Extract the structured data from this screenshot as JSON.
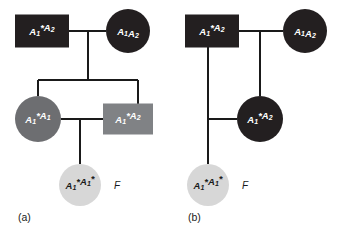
{
  "figure": {
    "type": "pedigree-diagram",
    "background_color": "#ffffff",
    "line_color": "#1a1a1a",
    "panel_count": 2
  },
  "colors": {
    "black": "#231f20",
    "dark_gray": "#6d6e71",
    "mid_gray": "#808285",
    "light_gray": "#d7d7d7",
    "white_text": "#ffffff",
    "dark_text": "#1a1a1a",
    "line": "#1a1a1a"
  },
  "panels": [
    {
      "id": "panel-a",
      "caption": "(a)",
      "caption_x": 18,
      "caption_y": 218,
      "individuals": [
        {
          "id": "a-founder-male",
          "role": "founder-male",
          "shape": "square",
          "fill": "black",
          "text_color": "white_text",
          "cx": 42,
          "cy": 31,
          "width": 54,
          "height": 33,
          "genotype": {
            "allele1": {
              "letter": "A",
              "sub": "1",
              "star": true
            },
            "allele2": {
              "letter": "A",
              "sub": "2",
              "star": false
            }
          },
          "genotype_text": "A1*A2"
        },
        {
          "id": "a-founder-female",
          "role": "founder-female",
          "shape": "circle",
          "fill": "black",
          "text_color": "white_text",
          "cx": 128,
          "cy": 31,
          "radius": 22,
          "genotype": {
            "allele1": {
              "letter": "A",
              "sub": "1",
              "star": false
            },
            "allele2": {
              "letter": "A",
              "sub": "2",
              "star": false
            }
          },
          "genotype_text": "A1A2"
        },
        {
          "id": "a-child-female",
          "role": "generation2-female",
          "shape": "circle",
          "fill": "dark_gray",
          "text_color": "white_text",
          "cx": 38,
          "cy": 119,
          "radius": 23,
          "genotype": {
            "allele1": {
              "letter": "A",
              "sub": "1",
              "star": true
            },
            "allele2": {
              "letter": "A",
              "sub": "1",
              "star": false
            }
          },
          "genotype_text": "A1*A1"
        },
        {
          "id": "a-child-male",
          "role": "generation2-male",
          "shape": "square",
          "fill": "mid_gray",
          "text_color": "white_text",
          "cx": 128,
          "cy": 119,
          "width": 50,
          "height": 31,
          "genotype": {
            "allele1": {
              "letter": "A",
              "sub": "1",
              "star": true
            },
            "allele2": {
              "letter": "A",
              "sub": "2",
              "star": false
            }
          },
          "genotype_text": "A1*A2"
        },
        {
          "id": "a-inbred-offspring",
          "role": "generation3-female-inbred",
          "shape": "circle",
          "fill": "light_gray",
          "text_color": "dark_text",
          "cx": 80,
          "cy": 185,
          "radius": 21,
          "genotype": {
            "allele1": {
              "letter": "A",
              "sub": "1",
              "star": true
            },
            "allele2": {
              "letter": "A",
              "sub": "1",
              "star": true
            }
          },
          "genotype_text": "A1*A1*",
          "annotation": "F",
          "annotation_x": 117,
          "annotation_y": 186
        }
      ]
    },
    {
      "id": "panel-b",
      "caption": "(b)",
      "caption_x": 188,
      "caption_y": 218,
      "individuals": [
        {
          "id": "b-founder-male",
          "role": "founder-male",
          "shape": "square",
          "fill": "black",
          "text_color": "white_text",
          "cx": 212,
          "cy": 31,
          "width": 54,
          "height": 33,
          "genotype": {
            "allele1": {
              "letter": "A",
              "sub": "1",
              "star": true
            },
            "allele2": {
              "letter": "A",
              "sub": "2",
              "star": false
            }
          },
          "genotype_text": "A1*A2"
        },
        {
          "id": "b-founder-female",
          "role": "founder-female",
          "shape": "circle",
          "fill": "black",
          "text_color": "white_text",
          "cx": 305,
          "cy": 31,
          "radius": 22,
          "genotype": {
            "allele1": {
              "letter": "A",
              "sub": "1",
              "star": false
            },
            "allele2": {
              "letter": "A",
              "sub": "2",
              "star": false
            }
          },
          "genotype_text": "A1A2"
        },
        {
          "id": "b-daughter-female",
          "role": "generation2-female",
          "shape": "circle",
          "fill": "black",
          "text_color": "white_text",
          "cx": 260,
          "cy": 119,
          "radius": 23,
          "genotype": {
            "allele1": {
              "letter": "A",
              "sub": "1",
              "star": true
            },
            "allele2": {
              "letter": "A",
              "sub": "2",
              "star": false
            }
          },
          "genotype_text": "A1*A2"
        },
        {
          "id": "b-inbred-offspring",
          "role": "generation3-female-inbred",
          "shape": "circle",
          "fill": "light_gray",
          "text_color": "dark_text",
          "cx": 208,
          "cy": 185,
          "radius": 21,
          "genotype": {
            "allele1": {
              "letter": "A",
              "sub": "1",
              "star": true
            },
            "allele2": {
              "letter": "A",
              "sub": "1",
              "star": true
            }
          },
          "genotype_text": "A1*A1*",
          "annotation": "F",
          "annotation_x": 245,
          "annotation_y": 186
        }
      ]
    }
  ],
  "connectors": {
    "panel_a": [
      {
        "name": "mating-line-gen1",
        "x1": 69,
        "y1": 31,
        "x2": 106,
        "y2": 31
      },
      {
        "name": "descent-drop",
        "x1": 88,
        "y1": 31,
        "x2": 88,
        "y2": 80
      },
      {
        "name": "sibship-bar",
        "x1": 38,
        "y1": 80,
        "x2": 138,
        "y2": 80
      },
      {
        "name": "sib-stub-left",
        "x1": 38,
        "y1": 80,
        "x2": 38,
        "y2": 96
      },
      {
        "name": "sib-stub-right",
        "x1": 138,
        "y1": 80,
        "x2": 138,
        "y2": 104
      },
      {
        "name": "mating-line-gen2",
        "x1": 61,
        "y1": 119,
        "x2": 103,
        "y2": 119
      },
      {
        "name": "offspring-drop",
        "x1": 80,
        "y1": 119,
        "x2": 80,
        "y2": 164
      }
    ],
    "panel_b": [
      {
        "name": "mating-line-gen1",
        "x1": 239,
        "y1": 31,
        "x2": 283,
        "y2": 31
      },
      {
        "name": "descent-drop-to-daughter",
        "x1": 260,
        "y1": 31,
        "x2": 260,
        "y2": 96
      },
      {
        "name": "father-drop",
        "x1": 208,
        "y1": 47,
        "x2": 208,
        "y2": 164
      },
      {
        "name": "mating-line-gen2",
        "x1": 208,
        "y1": 119,
        "x2": 237,
        "y2": 119
      }
    ]
  }
}
